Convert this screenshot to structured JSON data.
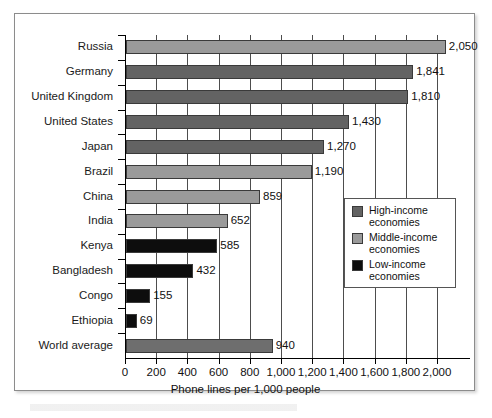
{
  "chart_data": {
    "type": "bar",
    "orientation": "horizontal",
    "title": "",
    "xlabel": "Phone lines per 1,000 people",
    "ylabel": "",
    "xlim": [
      0,
      2200
    ],
    "xticks": [
      0,
      200,
      400,
      600,
      800,
      1000,
      1200,
      1400,
      1600,
      1800,
      2000
    ],
    "xtick_labels": [
      "0",
      "200",
      "400",
      "600",
      "800",
      "1,000",
      "1,200",
      "1,400",
      "1,600",
      "1,800",
      "2,000"
    ],
    "grid": "vertical",
    "legend_position": "inside-right",
    "categories": [
      "Russia",
      "Germany",
      "United Kingdom",
      "United States",
      "Japan",
      "Brazil",
      "China",
      "India",
      "Kenya",
      "Bangladesh",
      "Congo",
      "Ethiopia",
      "World average"
    ],
    "values": [
      2050,
      1841,
      1810,
      1430,
      1270,
      1190,
      859,
      652,
      585,
      432,
      155,
      69,
      940
    ],
    "value_labels": [
      "2,050",
      "1,841",
      "1,810",
      "1,430",
      "1,270",
      "1,190",
      "859",
      "652",
      "585",
      "432",
      "155",
      "69",
      "940"
    ],
    "groups": [
      "middle",
      "high",
      "high",
      "high",
      "high",
      "middle",
      "middle",
      "middle",
      "low",
      "low",
      "low",
      "low",
      "world"
    ],
    "series": [
      {
        "name": "Phone lines per 1,000 people",
        "values": [
          2050,
          1841,
          1810,
          1430,
          1270,
          1190,
          859,
          652,
          585,
          432,
          155,
          69,
          940
        ]
      }
    ]
  },
  "legend": {
    "items": [
      {
        "swatch": "high",
        "label": "High-income\neconomies",
        "line1": "High-income",
        "line2": "economies",
        "color": "#636363"
      },
      {
        "swatch": "middle",
        "label": "Middle-income\neconomies",
        "line1": "Middle-income",
        "line2": "economies",
        "color": "#9a9a9a"
      },
      {
        "swatch": "low",
        "label": "Low-income\neconomies",
        "line1": "Low-income",
        "line2": "economies",
        "color": "#0d0d0d"
      }
    ]
  },
  "rows": [
    {
      "label": "Russia",
      "value_label": "2,050",
      "value": 2050,
      "group": "middle"
    },
    {
      "label": "Germany",
      "value_label": "1,841",
      "value": 1841,
      "group": "high"
    },
    {
      "label": "United Kingdom",
      "value_label": "1,810",
      "value": 1810,
      "group": "high"
    },
    {
      "label": "United States",
      "value_label": "1,430",
      "value": 1430,
      "group": "high"
    },
    {
      "label": "Japan",
      "value_label": "1,270",
      "value": 1270,
      "group": "high"
    },
    {
      "label": "Brazil",
      "value_label": "1,190",
      "value": 1190,
      "group": "middle"
    },
    {
      "label": "China",
      "value_label": "859",
      "value": 859,
      "group": "middle"
    },
    {
      "label": "India",
      "value_label": "652",
      "value": 652,
      "group": "middle"
    },
    {
      "label": "Kenya",
      "value_label": "585",
      "value": 585,
      "group": "low"
    },
    {
      "label": "Bangladesh",
      "value_label": "432",
      "value": 432,
      "group": "low"
    },
    {
      "label": "Congo",
      "value_label": "155",
      "value": 155,
      "group": "low"
    },
    {
      "label": "Ethiopia",
      "value_label": "69",
      "value": 69,
      "group": "low"
    },
    {
      "label": "World average",
      "value_label": "940",
      "value": 940,
      "group": "world"
    }
  ],
  "axis": {
    "title": "Phone lines per 1,000 people",
    "ticks": [
      "0",
      "200",
      "400",
      "600",
      "800",
      "1,000",
      "1,200",
      "1,400",
      "1,600",
      "1,800",
      "2,000"
    ]
  }
}
